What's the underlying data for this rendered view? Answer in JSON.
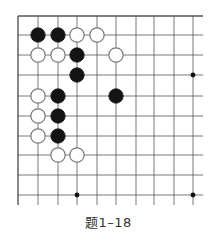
{
  "caption": "题1–18",
  "board": {
    "cols_x": [
      18,
      38,
      58,
      77,
      97,
      116,
      136,
      154,
      174,
      193
    ],
    "rows_y": [
      16,
      35,
      55,
      75,
      96,
      116,
      136,
      155,
      175,
      195
    ],
    "edge_left": true,
    "edge_top": true,
    "line_color": "#555555",
    "stones": [
      {
        "color": "black",
        "col": 1,
        "row": 1
      },
      {
        "color": "black",
        "col": 2,
        "row": 1
      },
      {
        "color": "white",
        "col": 3,
        "row": 1
      },
      {
        "color": "white",
        "col": 4,
        "row": 1
      },
      {
        "color": "white",
        "col": 1,
        "row": 2
      },
      {
        "color": "white",
        "col": 2,
        "row": 2
      },
      {
        "color": "black",
        "col": 3,
        "row": 2
      },
      {
        "color": "white",
        "col": 5,
        "row": 2
      },
      {
        "color": "black",
        "col": 3,
        "row": 3
      },
      {
        "color": "white",
        "col": 1,
        "row": 4
      },
      {
        "color": "black",
        "col": 2,
        "row": 4
      },
      {
        "color": "black",
        "col": 5,
        "row": 4
      },
      {
        "color": "white",
        "col": 1,
        "row": 5
      },
      {
        "color": "black",
        "col": 2,
        "row": 5
      },
      {
        "color": "white",
        "col": 1,
        "row": 6
      },
      {
        "color": "black",
        "col": 2,
        "row": 6
      },
      {
        "color": "white",
        "col": 2,
        "row": 7
      },
      {
        "color": "white",
        "col": 3,
        "row": 7
      }
    ],
    "star_points": [
      {
        "col": 9,
        "row": 3
      },
      {
        "col": 3,
        "row": 9
      },
      {
        "col": 9,
        "row": 9
      }
    ]
  }
}
